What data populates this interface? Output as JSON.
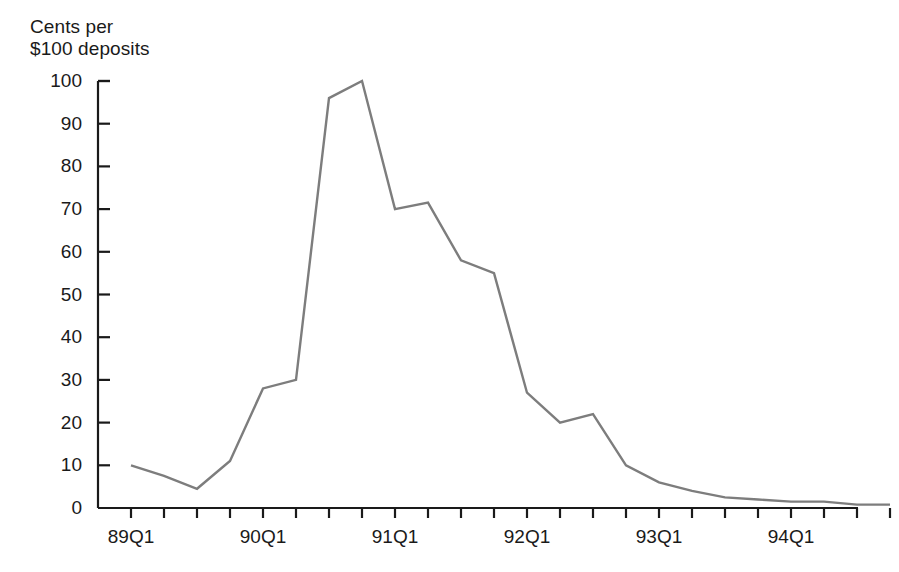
{
  "chart_data": {
    "type": "line",
    "title": "",
    "ylabel": "Cents per\n$100 deposits",
    "xlabel": "",
    "ylim": [
      0,
      100
    ],
    "yticks": [
      0,
      10,
      20,
      30,
      40,
      50,
      60,
      70,
      80,
      90,
      100
    ],
    "ytick_labels": [
      "0",
      "10",
      "20",
      "30",
      "40",
      "50",
      "60",
      "70",
      "80",
      "90",
      "100"
    ],
    "x": [
      "89Q1",
      "89Q2",
      "89Q3",
      "89Q4",
      "90Q1",
      "90Q2",
      "90Q3",
      "90Q4",
      "91Q1",
      "91Q2",
      "91Q3",
      "91Q4",
      "92Q1",
      "92Q2",
      "92Q3",
      "92Q4",
      "93Q1",
      "93Q2",
      "93Q3",
      "93Q4",
      "94Q1",
      "94Q2",
      "94Q3",
      "94Q4"
    ],
    "values": [
      10,
      7.5,
      4.5,
      11,
      28,
      30,
      96,
      100,
      70,
      71.5,
      58,
      55,
      27,
      20,
      22,
      10,
      6,
      4,
      2.5,
      2,
      1.5,
      1.5,
      0.8,
      0.8
    ],
    "xtick_labels": [
      "89Q1",
      "90Q1",
      "91Q1",
      "92Q1",
      "93Q1",
      "94Q1"
    ],
    "xtick_label_indices": [
      0,
      4,
      8,
      12,
      16,
      20
    ],
    "grid": false,
    "legend": "none",
    "series_color": "#7d7d7d",
    "axis_color": "#1a1a1a"
  }
}
